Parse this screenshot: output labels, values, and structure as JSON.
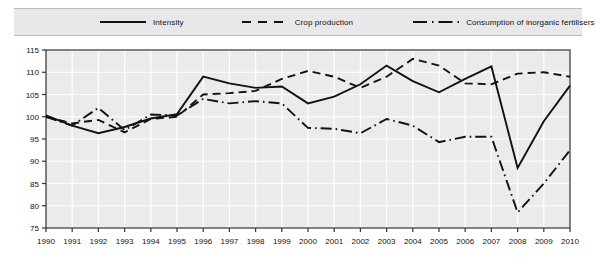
{
  "legend": {
    "entries": [
      {
        "label": "Intensity",
        "style": "solid",
        "icon": "line-solid-icon"
      },
      {
        "label": "Crop production",
        "style": "dashed",
        "icon": "line-dashed-icon"
      },
      {
        "label": "Consumption of inorganic fertilisers",
        "style": "dashdot",
        "icon": "line-dashdot-icon"
      }
    ]
  },
  "chart_data": {
    "type": "line",
    "title": "",
    "xlabel": "",
    "ylabel": "",
    "x": [
      1990,
      1991,
      1992,
      1993,
      1994,
      1995,
      1996,
      1997,
      1998,
      1999,
      2000,
      2001,
      2002,
      2003,
      2004,
      2005,
      2006,
      2007,
      2008,
      2009,
      2010
    ],
    "categories": [
      "1990",
      "1991",
      "1992",
      "1993",
      "1994",
      "1995",
      "1996",
      "1997",
      "1998",
      "1999",
      "2000",
      "2001",
      "2002",
      "2003",
      "2004",
      "2005",
      "2006",
      "2007",
      "2008",
      "2009",
      "2010"
    ],
    "xlim": [
      1990,
      2010
    ],
    "ylim": [
      75,
      115
    ],
    "yticks": [
      75,
      80,
      85,
      90,
      95,
      100,
      105,
      110,
      115
    ],
    "grid": true,
    "legend_position": "top",
    "series": [
      {
        "name": "Intensity",
        "style": "solid",
        "values": [
          100.3,
          98.0,
          96.3,
          97.7,
          99.6,
          100.6,
          109.0,
          107.5,
          106.5,
          106.8,
          103.0,
          104.5,
          107.3,
          111.5,
          108.0,
          105.5,
          108.5,
          111.3,
          88.5,
          99.0,
          107.0
        ]
      },
      {
        "name": "Crop production",
        "style": "dashed",
        "values": [
          100.0,
          98.5,
          99.3,
          96.5,
          99.5,
          100.0,
          105.0,
          105.3,
          105.8,
          108.5,
          110.3,
          109.0,
          106.5,
          109.0,
          113.0,
          111.5,
          107.5,
          107.3,
          109.7,
          110.0,
          109.0
        ]
      },
      {
        "name": "Consumption of inorganic fertilisers",
        "style": "dashdot",
        "values": [
          100.0,
          98.0,
          102.0,
          97.0,
          100.5,
          100.3,
          104.0,
          103.0,
          103.5,
          103.0,
          97.5,
          97.3,
          96.3,
          99.5,
          98.0,
          94.3,
          95.5,
          95.5,
          78.5,
          85.0,
          92.5
        ]
      }
    ]
  }
}
